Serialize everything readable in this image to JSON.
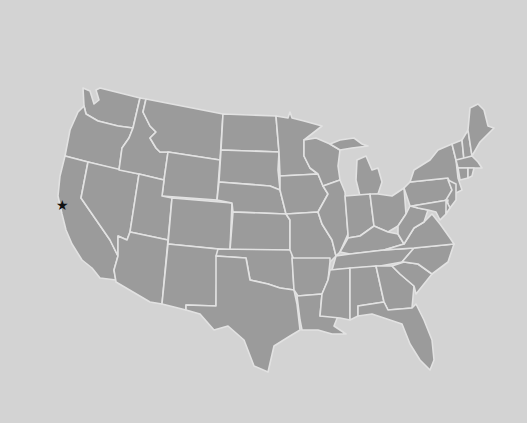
{
  "map": {
    "type": "choropleth-outline",
    "region": "Contiguous United States",
    "colors": {
      "background": "#d3d3d3",
      "land": "#9b9b9b",
      "border": "#e2e2e2",
      "marker": "#111111"
    },
    "states": [
      "WA",
      "OR",
      "CA",
      "NV",
      "ID",
      "MT",
      "WY",
      "UT",
      "AZ",
      "CO",
      "NM",
      "ND",
      "SD",
      "NE",
      "KS",
      "OK",
      "TX",
      "MN",
      "IA",
      "MO",
      "AR",
      "LA",
      "WI",
      "IL",
      "MI",
      "IN",
      "OH",
      "KY",
      "TN",
      "MS",
      "AL",
      "GA",
      "FL",
      "SC",
      "NC",
      "VA",
      "WV",
      "PA",
      "NY",
      "VT",
      "NH",
      "ME",
      "MA",
      "CT",
      "RI",
      "NJ",
      "DE",
      "MD"
    ],
    "marker": {
      "icon": "star-icon",
      "glyph": "★",
      "location": "San Francisco Bay Area, CA",
      "x": 62,
      "y": 205
    }
  }
}
